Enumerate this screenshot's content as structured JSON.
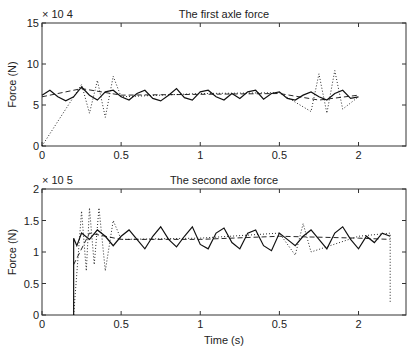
{
  "chart_data": [
    {
      "type": "line",
      "title": "The first axle force",
      "xlabel": "",
      "ylabel": "Force (N)",
      "y_multiplier": "× 10^4",
      "xlim": [
        0,
        2.3
      ],
      "ylim": [
        0,
        15
      ],
      "xtick_labels": [
        "0",
        "0.5",
        "1",
        "0.5",
        "2"
      ],
      "ytick_labels": [
        "0",
        "5",
        "10",
        "15"
      ],
      "grid": false,
      "series": [
        {
          "name": "solid",
          "style": "solid",
          "x": [
            0,
            0.05,
            0.1,
            0.15,
            0.2,
            0.25,
            0.3,
            0.35,
            0.4,
            0.45,
            0.5,
            0.55,
            0.6,
            0.65,
            0.7,
            0.75,
            0.8,
            0.85,
            0.9,
            0.95,
            1.0,
            1.05,
            1.1,
            1.15,
            1.2,
            1.25,
            1.3,
            1.35,
            1.4,
            1.45,
            1.5,
            1.55,
            1.6,
            1.65,
            1.7,
            1.75,
            1.8,
            1.85,
            1.9,
            1.95,
            2.0
          ],
          "values": [
            6.2,
            6.8,
            6.0,
            5.5,
            6.0,
            7.2,
            6.2,
            5.6,
            6.6,
            6.8,
            6.0,
            5.6,
            6.4,
            6.8,
            5.8,
            5.5,
            6.2,
            7.0,
            5.9,
            5.6,
            6.6,
            6.8,
            6.0,
            5.6,
            6.4,
            5.8,
            6.6,
            6.8,
            5.7,
            6.4,
            6.6,
            5.8,
            5.6,
            6.2,
            6.6,
            6.0,
            5.6,
            6.4,
            6.8,
            5.8,
            6.0
          ]
        },
        {
          "name": "dashed",
          "style": "dashed",
          "x": [
            0,
            0.25,
            0.5,
            1.0,
            1.5,
            1.75,
            2.0
          ],
          "values": [
            6.0,
            7.0,
            6.2,
            6.3,
            6.4,
            5.6,
            6.2
          ]
        },
        {
          "name": "dotted",
          "style": "dotted",
          "x": [
            0,
            0.25,
            0.3,
            0.35,
            0.4,
            0.45,
            0.5,
            1.0,
            1.5,
            1.7,
            1.75,
            1.8,
            1.85,
            1.9,
            2.0
          ],
          "values": [
            0,
            7.5,
            4.0,
            8.0,
            3.5,
            8.5,
            6.0,
            6.4,
            6.5,
            4.2,
            8.8,
            4.0,
            9.2,
            4.5,
            6.0
          ]
        }
      ]
    },
    {
      "type": "line",
      "title": "The second axle force",
      "xlabel": "Time (s)",
      "ylabel": "Force (N)",
      "y_multiplier": "× 10^5",
      "xlim": [
        0,
        2.3
      ],
      "ylim": [
        0,
        2
      ],
      "xtick_labels": [
        "0",
        "0.5",
        "1",
        "0.5",
        "2"
      ],
      "ytick_labels": [
        "0",
        "0.5",
        "1",
        "1.5",
        "2"
      ],
      "grid": false,
      "series": [
        {
          "name": "solid",
          "style": "solid",
          "x": [
            0.2,
            0.2,
            0.22,
            0.25,
            0.3,
            0.35,
            0.4,
            0.45,
            0.5,
            0.55,
            0.6,
            0.65,
            0.7,
            0.75,
            0.8,
            0.85,
            0.9,
            0.95,
            1.0,
            1.05,
            1.1,
            1.15,
            1.2,
            1.25,
            1.3,
            1.35,
            1.4,
            1.45,
            1.5,
            1.55,
            1.6,
            1.65,
            1.7,
            1.75,
            1.8,
            1.85,
            1.9,
            1.95,
            2.0,
            2.05,
            2.1,
            2.15,
            2.2
          ],
          "values": [
            0,
            1.22,
            1.1,
            1.3,
            1.2,
            1.35,
            1.25,
            1.1,
            1.25,
            1.35,
            1.2,
            1.05,
            1.25,
            1.4,
            1.2,
            1.08,
            1.25,
            1.4,
            1.12,
            1.05,
            1.3,
            1.38,
            1.15,
            1.05,
            1.3,
            1.35,
            1.1,
            1.02,
            1.3,
            1.2,
            1.1,
            1.25,
            1.35,
            1.2,
            1.05,
            1.3,
            1.4,
            1.2,
            1.05,
            1.25,
            1.15,
            1.3,
            1.25
          ]
        },
        {
          "name": "dashed",
          "style": "dashed",
          "x": [
            0.2,
            0.3,
            0.5,
            1.0,
            1.5,
            2.0,
            2.2
          ],
          "values": [
            0.8,
            1.3,
            1.2,
            1.2,
            1.25,
            1.22,
            1.2
          ]
        },
        {
          "name": "dotted",
          "style": "dotted",
          "x": [
            0.2,
            0.25,
            0.28,
            0.3,
            0.33,
            0.36,
            0.4,
            0.45,
            0.5,
            1.0,
            1.5,
            1.6,
            1.65,
            1.7,
            2.0,
            2.2,
            2.2
          ],
          "values": [
            0,
            1.65,
            0.7,
            1.7,
            0.8,
            1.7,
            0.7,
            1.5,
            1.2,
            1.22,
            1.3,
            0.95,
            1.45,
            1.0,
            1.25,
            1.3,
            0.2
          ]
        }
      ]
    }
  ]
}
